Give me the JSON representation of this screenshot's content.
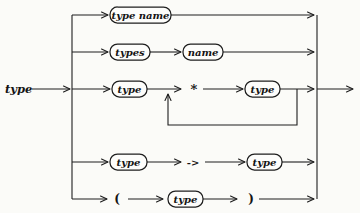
{
  "diagram": {
    "entry_label": "type",
    "rows": [
      {
        "name": "type-name-alternative",
        "items": [
          {
            "kind": "box",
            "label": "type name"
          }
        ]
      },
      {
        "name": "parameterized-type-alternative",
        "items": [
          {
            "kind": "box",
            "label": "types"
          },
          {
            "kind": "box",
            "label": "name"
          }
        ]
      },
      {
        "name": "tuple-type-alternative",
        "loop": true,
        "items": [
          {
            "kind": "box",
            "label": "type"
          },
          {
            "kind": "literal",
            "label": "*"
          },
          {
            "kind": "box",
            "label": "type"
          }
        ]
      },
      {
        "name": "function-type-alternative",
        "items": [
          {
            "kind": "box",
            "label": "type"
          },
          {
            "kind": "literal",
            "label": "->"
          },
          {
            "kind": "box",
            "label": "type"
          }
        ]
      },
      {
        "name": "parenthesized-type-alternative",
        "items": [
          {
            "kind": "literal",
            "label": "("
          },
          {
            "kind": "box",
            "label": "type"
          },
          {
            "kind": "literal",
            "label": ")"
          }
        ]
      }
    ]
  },
  "colors": {
    "background": "#fbfbf8",
    "line": "#1e1e1e",
    "box_fill": "#fdfdfb",
    "text": "#141414"
  }
}
